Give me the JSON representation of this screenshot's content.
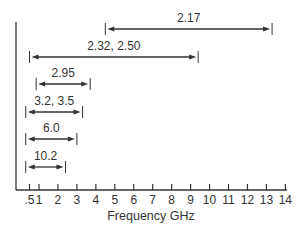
{
  "chart_data": {
    "type": "range-bar",
    "title": "",
    "xlabel": "Frequency GHz",
    "ylabel": "",
    "xlim": [
      0,
      14
    ],
    "grid": false,
    "x_ticks": [
      {
        "value": 0.5,
        "label": ".5"
      },
      {
        "value": 1,
        "label": "1"
      },
      {
        "value": 2,
        "label": "2"
      },
      {
        "value": 3,
        "label": "3"
      },
      {
        "value": 4,
        "label": "4"
      },
      {
        "value": 5,
        "label": "5"
      },
      {
        "value": 6,
        "label": "6"
      },
      {
        "value": 7,
        "label": "7"
      },
      {
        "value": 8,
        "label": "8"
      },
      {
        "value": 9,
        "label": "9"
      },
      {
        "value": 10,
        "label": "10"
      },
      {
        "value": 11,
        "label": "11"
      },
      {
        "value": 12,
        "label": "12"
      },
      {
        "value": 13,
        "label": "13"
      },
      {
        "value": 14,
        "label": "14"
      }
    ],
    "ranges": [
      {
        "label": "2.17",
        "start": 4.5,
        "end": 13.3
      },
      {
        "label": "2.32, 2.50",
        "start": 0.5,
        "end": 9.4
      },
      {
        "label": "2.95",
        "start": 0.85,
        "end": 3.7
      },
      {
        "label": "3.2, 3.5",
        "start": 0.3,
        "end": 3.3
      },
      {
        "label": "6.0",
        "start": 0.3,
        "end": 3.0
      },
      {
        "label": "10.2",
        "start": 0.3,
        "end": 2.4
      }
    ],
    "colors": {
      "line": "#333333",
      "text": "#333333",
      "background": "#ffffff"
    }
  }
}
